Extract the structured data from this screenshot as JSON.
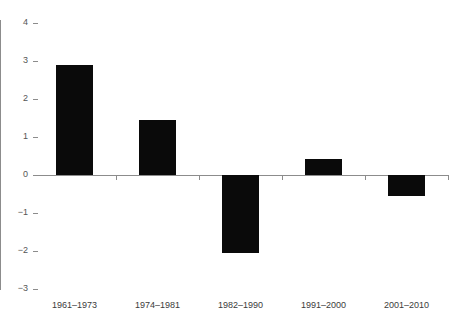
{
  "chart_data": {
    "type": "bar",
    "title": "",
    "subtitle": "",
    "xlabel": "",
    "ylabel": "",
    "categories": [
      "1961–1973",
      "1974–1981",
      "1982–1990",
      "1991–2000",
      "2001–2010"
    ],
    "values": [
      2.9,
      1.45,
      -2.05,
      0.42,
      -0.55
    ],
    "ylim": [
      -3,
      4
    ],
    "yticks": [
      4,
      3,
      2,
      1,
      0,
      -1,
      -2,
      -3
    ],
    "ytick_labels": [
      "4",
      "3",
      "2",
      "1",
      "0",
      "−1",
      "−2",
      "−3"
    ],
    "grid": false,
    "legend": null,
    "legend_position": "none",
    "bar_color": "#0a0a0a",
    "axis_color": "#8c8c8c",
    "background_color": "#ffffff",
    "zero_line": 0,
    "series": [
      {
        "name": "",
        "values": [
          2.9,
          1.45,
          -2.05,
          0.42,
          -0.55
        ]
      }
    ]
  }
}
